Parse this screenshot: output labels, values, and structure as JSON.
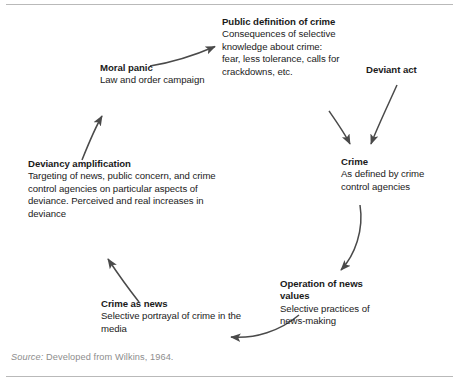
{
  "figure": {
    "ink_color": "#1a1a1a",
    "arrow_color": "#4a4a4a",
    "rule_color": "#b9b9b9",
    "source_color": "#8d8d8d"
  },
  "nodes": {
    "public_definition": {
      "heading": "Public definition of crime",
      "body": "Consequences of selective knowledge about crime: fear, less tolerance, calls for crackdowns, etc."
    },
    "moral_panic": {
      "heading": "Moral panic",
      "body": "Law and order campaign"
    },
    "deviant_act": {
      "heading": "Deviant act",
      "body": ""
    },
    "crime": {
      "heading": "Crime",
      "body": "As defined by crime control agencies"
    },
    "deviancy_amplification": {
      "heading": "Deviancy amplification",
      "body": "Targeting of news, public concern, and crime control agencies on particular aspects of deviance. Perceived and real increases in deviance"
    },
    "operation_of_news_values": {
      "heading": "Operation of news values",
      "body": "Selective practices of news-making"
    },
    "crime_as_news": {
      "heading": "Crime as news",
      "body": "Selective portrayal of crime in the media"
    }
  },
  "arrows": [
    {
      "name": "moral-panic-to-public-definition",
      "from": "moral_panic",
      "to": "public_definition"
    },
    {
      "name": "deviancy-amplification-to-moral-panic",
      "from": "deviancy_amplification",
      "to": "moral_panic"
    },
    {
      "name": "public-definition-to-crime",
      "from": "public_definition",
      "to": "crime"
    },
    {
      "name": "deviant-act-to-crime",
      "from": "deviant_act",
      "to": "crime"
    },
    {
      "name": "crime-to-operation-of-news-values",
      "from": "crime",
      "to": "operation_of_news_values"
    },
    {
      "name": "operation-of-news-values-to-crime-as-news",
      "from": "operation_of_news_values",
      "to": "crime_as_news"
    },
    {
      "name": "crime-as-news-to-deviancy-amplification",
      "from": "crime_as_news",
      "to": "deviancy_amplification"
    }
  ],
  "source": {
    "label": "Source:",
    "text": "Developed from Wilkins, 1964."
  }
}
